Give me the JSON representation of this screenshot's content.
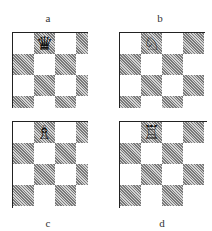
{
  "figure": {
    "diagrams": [
      {
        "label": "a",
        "piece_name": "black-queen",
        "piece_glyph": "♛",
        "piece_square": {
          "row": 0,
          "col": 1
        }
      },
      {
        "label": "b",
        "piece_name": "white-knight",
        "piece_glyph": "♘",
        "piece_square": {
          "row": 0,
          "col": 1
        }
      },
      {
        "label": "c",
        "piece_name": "white-bishop",
        "piece_glyph": "♗",
        "piece_square": {
          "row": 0,
          "col": 1
        }
      },
      {
        "label": "d",
        "piece_name": "white-rook",
        "piece_glyph": "♖",
        "piece_square": {
          "row": 0,
          "col": 1
        }
      }
    ],
    "colors": {
      "light_square": "#ffffff",
      "dark_square_hatch": "#7a7a7a",
      "border": "#222222"
    }
  }
}
